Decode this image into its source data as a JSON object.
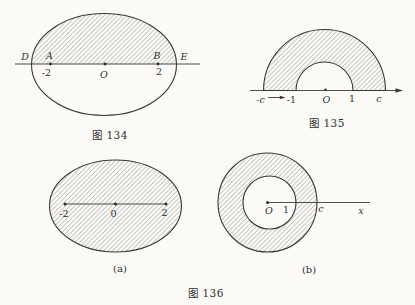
{
  "page": {
    "background": "#fbfaf7",
    "ink_color": "#3a3a3a",
    "hatch_color": "#9c9c9c",
    "text_color": "#2f2f2f"
  },
  "fig134": {
    "caption": "图 134",
    "point_D": "D",
    "point_A": "A",
    "point_B": "B",
    "point_E": "E",
    "origin": "O",
    "tick_neg2": "-2",
    "tick_pos2": "2"
  },
  "fig135": {
    "caption": "图 135",
    "tick_negc": "-c",
    "tick_neg1": "-1",
    "origin": "O",
    "tick_pos1": "1",
    "tick_posc": "c"
  },
  "fig136": {
    "caption": "图 136",
    "a": {
      "caption": "(a)",
      "tick_neg2": "-2",
      "tick_zero": "0",
      "tick_pos2": "2"
    },
    "b": {
      "caption": "(b)",
      "origin": "O",
      "tick_one": "1",
      "tick_c": "c",
      "axis_label": "x"
    }
  }
}
